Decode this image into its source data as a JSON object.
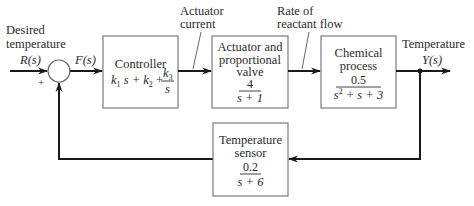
{
  "diagram": {
    "type": "feedback-control-block-diagram",
    "input": {
      "label_line1": "Desired",
      "label_line2": "temperature",
      "signal": "R(s)"
    },
    "summing_junction": {
      "input_sign": "+",
      "output_signal": "F(s)"
    },
    "blocks": {
      "controller": {
        "title": "Controller",
        "tf_part1": "k",
        "tf_sub1": "1",
        "tf_part2": "s + k",
        "tf_sub2": "2",
        "tf_part3": " + ",
        "tf_frac_num": "k",
        "tf_frac_num_sub": "3",
        "tf_frac_den": "s"
      },
      "actuator": {
        "title_line1": "Actuator and",
        "title_line2": "proportional",
        "title_line3": "valve",
        "numerator": "4",
        "denominator": "s + 1"
      },
      "process": {
        "title_line1": "Chemical",
        "title_line2": "process",
        "numerator": "0.5",
        "den_a": "s",
        "den_sup": "2",
        "den_b": " + s + 3"
      },
      "sensor": {
        "title_line1": "Temperature",
        "title_line2": "sensor",
        "numerator": "0.2",
        "denominator": "s + 6"
      }
    },
    "signals": {
      "actuator_current_line1": "Actuator",
      "actuator_current_line2": "current",
      "reactant_flow_line1": "Rate of",
      "reactant_flow_line2": "reactant flow",
      "output_label": "Temperature",
      "output_signal": "Y(s)"
    }
  }
}
